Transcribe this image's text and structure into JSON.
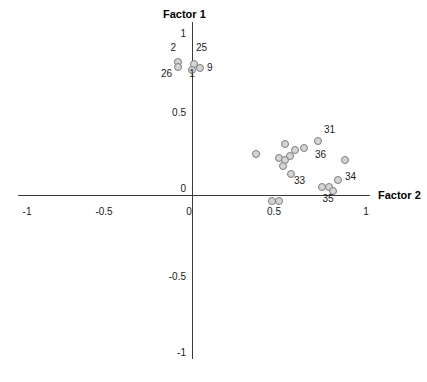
{
  "chart": {
    "type": "scatter",
    "title": "",
    "xlabel": "Factor 2",
    "ylabel": "Factor 1"
  },
  "axes": {
    "x_title": "Factor 2",
    "y_title": "Factor 1",
    "x_ticks": [
      {
        "label": "-1",
        "value": -1,
        "px": 27
      },
      {
        "label": "-0.5",
        "value": -0.5,
        "px": 104
      },
      {
        "label": "0",
        "value": 0,
        "px": 189
      },
      {
        "label": "0.5",
        "value": 0.5,
        "px": 274
      },
      {
        "label": "1",
        "value": 1,
        "px": 366
      }
    ],
    "y_ticks": [
      {
        "label": "1",
        "value": 1,
        "px": 34
      },
      {
        "label": "0.5",
        "value": 0.5,
        "px": 113
      },
      {
        "label": "0",
        "value": 0,
        "px": 189
      },
      {
        "label": "-0.5",
        "value": -0.5,
        "px": 277
      },
      {
        "label": "-1",
        "value": -1,
        "px": 353
      }
    ]
  },
  "chart_data": {
    "type": "scatter",
    "title": "",
    "xlabel": "Factor 2",
    "ylabel": "Factor 1",
    "xlim": [
      -1.05,
      1.05
    ],
    "ylim": [
      -1.05,
      1.05
    ],
    "grid": false,
    "legend": null,
    "xticks": [
      -1,
      -0.5,
      0,
      0.5,
      1
    ],
    "xticklabels": [
      "-1",
      "-0.5",
      "0",
      "0.5",
      "1"
    ],
    "yticks": [
      -1,
      -0.5,
      0,
      0.5,
      1
    ],
    "yticklabels": [
      "-1",
      "-0.5",
      "0",
      "0.5",
      "1"
    ],
    "points": [
      {
        "label": "2",
        "x": -0.06,
        "y": 0.76,
        "px": 178,
        "py": 62,
        "label_px": 176,
        "label_py": 48,
        "label_anchor": "above-left"
      },
      {
        "label": "26",
        "x": -0.06,
        "y": 0.76,
        "px": 178,
        "py": 67,
        "label_px": 172,
        "label_py": 74,
        "label_anchor": "below-left"
      },
      {
        "label": "25",
        "x": 0.02,
        "y": 0.79,
        "px": 194,
        "py": 64,
        "label_px": 196,
        "label_py": 48,
        "label_anchor": "above-right"
      },
      {
        "label": "9",
        "x": 0.05,
        "y": 0.74,
        "px": 200,
        "py": 68,
        "label_px": 207,
        "label_py": 68,
        "label_anchor": "right"
      },
      {
        "label": "1",
        "x": 0.01,
        "y": 0.72,
        "px": 192,
        "py": 70,
        "label_px": 192,
        "label_py": 74,
        "label_anchor": "below"
      },
      {
        "label": "",
        "x": 0.31,
        "y": 0.22,
        "px": 256,
        "py": 154,
        "label_px": 0,
        "label_py": 0,
        "label_anchor": "none"
      },
      {
        "label": "",
        "x": 0.47,
        "y": 0.28,
        "px": 285,
        "py": 144,
        "label_px": 0,
        "label_py": 0,
        "label_anchor": "none"
      },
      {
        "label": "",
        "x": 0.44,
        "y": 0.19,
        "px": 279,
        "py": 158,
        "label_px": 0,
        "label_py": 0,
        "label_anchor": "none"
      },
      {
        "label": "",
        "x": 0.47,
        "y": 0.18,
        "px": 285,
        "py": 160,
        "label_px": 0,
        "label_py": 0,
        "label_anchor": "none"
      },
      {
        "label": "",
        "x": 0.5,
        "y": 0.2,
        "px": 290,
        "py": 156,
        "label_px": 0,
        "label_py": 0,
        "label_anchor": "none"
      },
      {
        "label": "",
        "x": 0.46,
        "y": 0.14,
        "px": 283,
        "py": 166,
        "label_px": 0,
        "label_py": 0,
        "label_anchor": "none"
      },
      {
        "label": "",
        "x": 0.52,
        "y": 0.24,
        "px": 295,
        "py": 150,
        "label_px": 0,
        "label_py": 0,
        "label_anchor": "none"
      },
      {
        "label": "",
        "x": 0.5,
        "y": 0.1,
        "px": 291,
        "py": 174,
        "label_px": 0,
        "label_py": 0,
        "label_anchor": "none"
      },
      {
        "label": "",
        "x": 0.57,
        "y": 0.25,
        "px": 304,
        "py": 148,
        "label_px": 0,
        "label_py": 0,
        "label_anchor": "none"
      },
      {
        "label": "31",
        "x": 0.66,
        "y": 0.29,
        "px": 318,
        "py": 141,
        "label_px": 324,
        "label_py": 130,
        "label_anchor": "above-right"
      },
      {
        "label": "36",
        "x": 0.79,
        "y": 0.18,
        "px": 345,
        "py": 160,
        "label_px": 326,
        "label_py": 155,
        "label_anchor": "left"
      },
      {
        "label": "33",
        "x": 0.68,
        "y": 0.03,
        "px": 322,
        "py": 187,
        "label_px": 305,
        "label_py": 181,
        "label_anchor": "left"
      },
      {
        "label": "",
        "x": 0.72,
        "y": 0.03,
        "px": 329,
        "py": 187,
        "label_px": 0,
        "label_py": 0,
        "label_anchor": "none"
      },
      {
        "label": "34",
        "x": 0.82,
        "y": 0.06,
        "px": 338,
        "py": 180,
        "label_px": 345,
        "label_py": 177,
        "label_anchor": "right"
      },
      {
        "label": "35",
        "x": 0.76,
        "y": -0.02,
        "px": 333,
        "py": 191,
        "label_px": 328,
        "label_py": 199,
        "label_anchor": "below"
      },
      {
        "label": "",
        "x": 0.49,
        "y": -0.06,
        "px": 272,
        "py": 201,
        "label_px": 0,
        "label_py": 0,
        "label_anchor": "none"
      },
      {
        "label": "",
        "x": 0.53,
        "y": -0.06,
        "px": 279,
        "py": 201,
        "label_px": 0,
        "label_py": 0,
        "label_anchor": "none"
      }
    ]
  },
  "colors": {
    "axis": "#3a3a3a",
    "marker_fill": "#d4d4d4",
    "marker_stroke": "#7d7d7d",
    "text": "#1a1a1a",
    "background": "#ffffff"
  }
}
